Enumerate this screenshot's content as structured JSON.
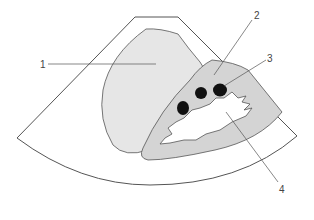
{
  "diagram": {
    "type": "ultrasound-schematic",
    "labels": [
      {
        "id": "1",
        "text": "1"
      },
      {
        "id": "2",
        "text": "2"
      },
      {
        "id": "3",
        "text": "3"
      },
      {
        "id": "4",
        "text": "4"
      }
    ],
    "colors": {
      "outline": "#555555",
      "region1_fill": "#e6e6e6",
      "region2_fill": "#d4d4d4",
      "region4_fill": "#ffffff",
      "dots": "#111111"
    }
  }
}
